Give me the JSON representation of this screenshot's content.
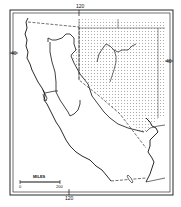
{
  "map": {
    "region": "California and Nevada",
    "shaded_region": "Great Basin / Nevada area",
    "graticule": {
      "top_longitude_label": "120",
      "bottom_longitude_label": "120",
      "left_latitude_label": "40",
      "right_latitude_label": "40"
    },
    "scale_bar": {
      "title": "MILES",
      "start": "0",
      "end": "200"
    },
    "colors": {
      "ink": "#111111",
      "background": "#ffffff",
      "stipple": "#555555"
    }
  }
}
